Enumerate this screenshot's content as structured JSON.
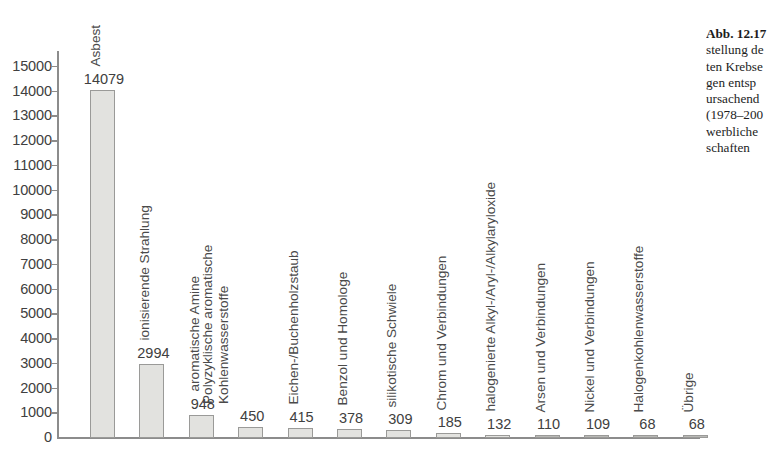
{
  "chart_data": {
    "type": "bar",
    "title": "",
    "subtitle": "",
    "xlabel": "",
    "ylabel": "",
    "ylim": [
      0,
      15000
    ],
    "grid": false,
    "legend": "none",
    "y_ticks": [
      "15000",
      "14000",
      "13000",
      "12000",
      "11000",
      "10000",
      "9000",
      "8000",
      "7000",
      "6000",
      "5000",
      "4000",
      "3000",
      "2000",
      "1000",
      "0"
    ],
    "categories": [
      "Asbest",
      "ionisierende Strahlung",
      "aromatische Amine",
      "Polyzyklische aromatische Kohlenwasserstoffe",
      "Eichen-/Buchenholzstaub",
      "Benzol und Homologe",
      "silikotische Schwiele",
      "Chrom und Verbindungen",
      "halogenierte Alkyl-/Aryl-/Alkylaryloxide",
      "Arsen und Verbindungen",
      "Nickel und Verbindungen",
      "Halogenkohlenwasserstoffe",
      "Übrige"
    ],
    "values": [
      14079,
      2994,
      948,
      450,
      415,
      378,
      309,
      185,
      132,
      110,
      109,
      68,
      68
    ],
    "value_labels": [
      "14079",
      "2994",
      "948",
      "450",
      "415",
      "378",
      "309",
      "185",
      "132",
      "110",
      "109",
      "68",
      "68"
    ],
    "category_label_lines": [
      [
        "Asbest"
      ],
      [
        "ionisierende Strahlung"
      ],
      [
        "aromatische Amine"
      ],
      [
        "Polyzyklische aromatische",
        "Kohlenwasserstoffe"
      ],
      [
        "Eichen-/Buchenholzstaub"
      ],
      [
        "Benzol und Homologe"
      ],
      [
        "silikotische Schwiele"
      ],
      [
        "Chrom und Verbindungen"
      ],
      [
        "halogenierte Alkyl-/Aryl-/Alkylaryloxide"
      ],
      [
        "Arsen und Verbindungen"
      ],
      [
        "Nickel und Verbindungen"
      ],
      [
        "Halogenkohlenwasserstoffe"
      ],
      [
        "Übrige"
      ]
    ],
    "colors": {
      "bar_fill": "#e2e2df",
      "bar_border": "#9a9a98",
      "axis": "#8c8c8c",
      "text": "#404040"
    }
  },
  "caption": {
    "lines": [
      "Abb. 12.17",
      "stellung de",
      "ten Krebse",
      "gen entsp",
      "ursachend",
      "(1978–200",
      "werbliche",
      "schaften"
    ]
  }
}
